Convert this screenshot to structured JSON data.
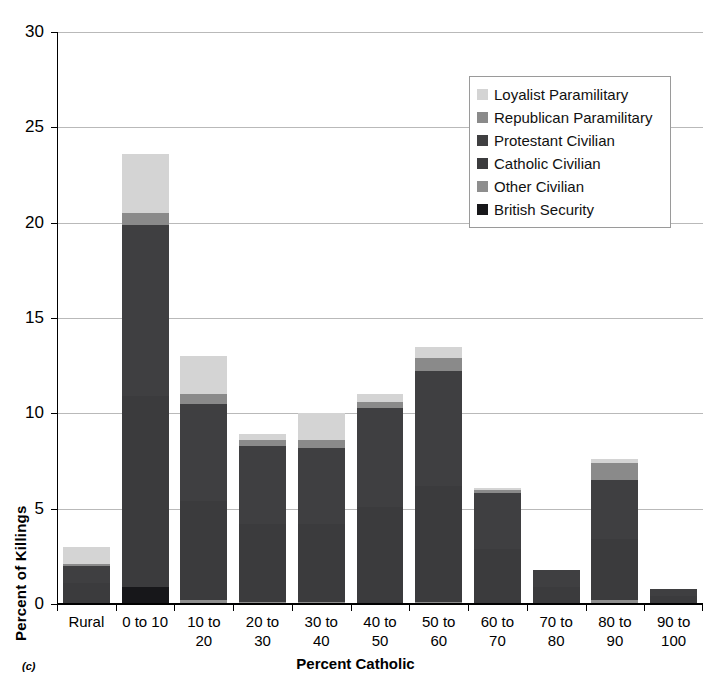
{
  "figure": {
    "caption": "(c)"
  },
  "chart_data": {
    "type": "bar",
    "stacked": true,
    "title": "",
    "xlabel": "Percent Catholic",
    "ylabel": "Percent of Killings",
    "ylim": [
      0,
      30
    ],
    "ytick_labels": [
      "0",
      "5",
      "10",
      "15",
      "20",
      "25",
      "30"
    ],
    "ytick_values": [
      0,
      5,
      10,
      15,
      20,
      25,
      30
    ],
    "grid": true,
    "grid_axis": "y",
    "legend_position": "upper right",
    "categories": [
      "Rural",
      "0 to 10",
      "10 to\n20",
      "20 to\n30",
      "30 to\n40",
      "40 to\n50",
      "50 to\n60",
      "60 to\n70",
      "70 to\n80",
      "80 to\n90",
      "90 to\n100"
    ],
    "category_labels": [
      [
        "Rural",
        ""
      ],
      [
        "0 to 10",
        ""
      ],
      [
        "10 to",
        "20"
      ],
      [
        "20 to",
        "30"
      ],
      [
        "30 to",
        "40"
      ],
      [
        "40 to",
        "50"
      ],
      [
        "50 to",
        "60"
      ],
      [
        "60 to",
        "70"
      ],
      [
        "70 to",
        "80"
      ],
      [
        "80 to",
        "90"
      ],
      [
        "90 to",
        "100"
      ]
    ],
    "series": [
      {
        "name": "British Security",
        "color": "#17171a",
        "values": [
          0.0,
          0.9,
          0.0,
          0.0,
          0.0,
          0.0,
          0.0,
          0.0,
          0.0,
          0.0,
          0.0
        ]
      },
      {
        "name": "Other Civilian",
        "color": "#8e8e8e",
        "values": [
          0.0,
          0.0,
          0.2,
          0.1,
          0.1,
          0.0,
          0.1,
          0.0,
          0.0,
          0.2,
          0.0
        ]
      },
      {
        "name": "Catholic Civilian",
        "color": "#3b3b3d",
        "values": [
          1.1,
          10.0,
          5.2,
          4.1,
          4.1,
          5.1,
          6.1,
          2.9,
          0.9,
          3.2,
          0.4
        ]
      },
      {
        "name": "Protestant Civilian",
        "color": "#3f3f41",
        "values": [
          0.9,
          9.0,
          5.1,
          4.1,
          4.0,
          5.2,
          6.0,
          2.9,
          0.9,
          3.1,
          0.4
        ]
      },
      {
        "name": "Republican Paramilitary",
        "color": "#8a8a8a",
        "values": [
          0.1,
          0.6,
          0.5,
          0.3,
          0.4,
          0.3,
          0.7,
          0.2,
          0.0,
          0.9,
          0.0
        ]
      },
      {
        "name": "Loyalist Paramilitary",
        "color": "#d4d4d4",
        "values": [
          0.9,
          3.1,
          2.0,
          0.3,
          1.4,
          0.4,
          0.6,
          0.1,
          0.0,
          0.2,
          0.0
        ]
      }
    ],
    "totals": [
      3.0,
      23.6,
      13.0,
      8.9,
      10.0,
      11.0,
      13.5,
      6.1,
      1.8,
      7.6,
      0.8
    ]
  },
  "legend": {
    "entries": [
      {
        "label": "Loyalist Paramilitary",
        "color": "#d4d4d4"
      },
      {
        "label": "Republican Paramilitary",
        "color": "#8a8a8a"
      },
      {
        "label": "Protestant Civilian",
        "color": "#3f3f41"
      },
      {
        "label": "Catholic Civilian",
        "color": "#3b3b3d"
      },
      {
        "label": "Other Civilian",
        "color": "#8e8e8e"
      },
      {
        "label": "British Security",
        "color": "#17171a"
      }
    ]
  }
}
